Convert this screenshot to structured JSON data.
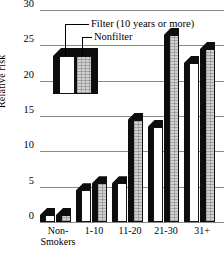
{
  "chart_data": {
    "type": "bar",
    "title": "",
    "xlabel": "",
    "ylabel": "Relative risk",
    "ylim": [
      0,
      30
    ],
    "yticks": [
      0,
      5,
      10,
      15,
      20,
      25,
      30
    ],
    "grid": true,
    "legend_position": "inside-upper-left",
    "categories": [
      "Non-Smokers",
      "1-10",
      "11-20",
      "21-30",
      "31+"
    ],
    "category_lines": [
      [
        "Non-",
        "Smokers"
      ],
      [
        "1-10"
      ],
      [
        "11-20"
      ],
      [
        "21-30"
      ],
      [
        "31+"
      ]
    ],
    "series": [
      {
        "name": "Filter (10 years or more)",
        "values": [
          1,
          4.5,
          5.5,
          13.5,
          22.5
        ]
      },
      {
        "name": "Nonfilter",
        "values": [
          1,
          5.5,
          14.5,
          26.5,
          24.5
        ]
      }
    ]
  },
  "legend": {
    "filter_label": "Filter (10 years or more)",
    "nonfilter_label": "Nonfilter"
  }
}
